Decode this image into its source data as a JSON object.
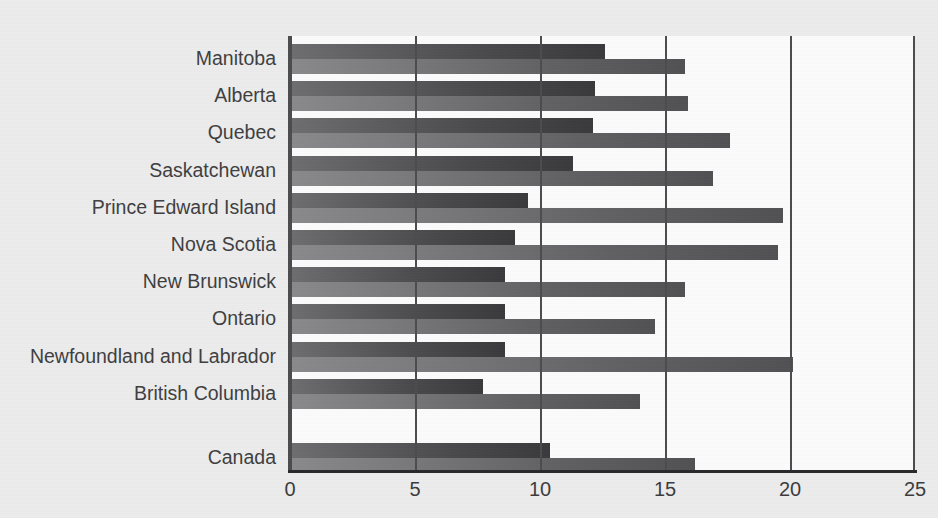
{
  "chart_data": {
    "type": "bar",
    "orientation": "horizontal",
    "title": "",
    "subtitle": "",
    "xlabel": "",
    "ylabel": "",
    "xlim": [
      0,
      25
    ],
    "xticks": [
      0,
      5,
      10,
      15,
      20,
      25
    ],
    "xtick_labels": [
      "0",
      "5",
      "10",
      "15",
      "20",
      "25"
    ],
    "grid": true,
    "grid_axis": "x",
    "legend": false,
    "legend_position": "none",
    "categories": [
      "Manitoba",
      "Alberta",
      "Quebec",
      "Saskatchewan",
      "Prince Edward Island",
      "Nova Scotia",
      "New Brunswick",
      "Ontario",
      "Newfoundland and Labrador",
      "British Columbia",
      "Canada"
    ],
    "series": [
      {
        "name": "series-1",
        "color": "#4a4a4c",
        "values": [
          12.6,
          12.2,
          12.1,
          11.3,
          9.5,
          9.0,
          8.6,
          8.6,
          8.6,
          7.7,
          10.4
        ]
      },
      {
        "name": "series-2",
        "color": "#6a6a6c",
        "values": [
          15.8,
          15.9,
          17.6,
          16.9,
          19.7,
          19.5,
          15.8,
          14.6,
          20.1,
          14.0,
          16.2
        ]
      }
    ]
  },
  "colors": {
    "background": "#ececed",
    "plot_background": "#fbfbfb",
    "axis": "#3c3c3e",
    "gridline": "#4c4c4e",
    "series_1": "#4a4a4c",
    "series_2": "#6a6a6c",
    "label_text": "#3f3f41"
  }
}
